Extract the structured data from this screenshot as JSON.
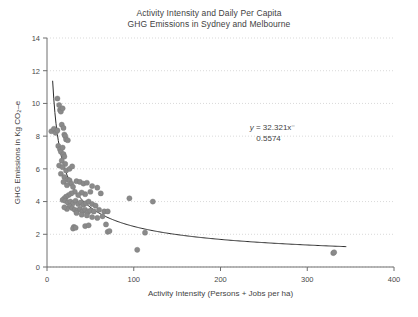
{
  "chart_data": {
    "type": "scatter",
    "title": "Activity Intensity and Daily Per Capita GHG Emissions in Sydney and Melbourne",
    "title_line1": "Activity Intensity and Daily Per Capita",
    "title_line2": "GHG Emissions in Sydney and Melbourne",
    "xlabel": "Activity Intensity (Persons + Jobs per ha)",
    "ylabel": "GHG Emissions in Kg CO₂–e",
    "xlim": [
      0,
      400
    ],
    "ylim": [
      0,
      14
    ],
    "xticks": [
      0,
      100,
      200,
      300,
      400
    ],
    "yticks": [
      0,
      2,
      4,
      6,
      8,
      10,
      12,
      14
    ],
    "xtick_labels": [
      "0",
      "100",
      "200",
      "300",
      "400"
    ],
    "ytick_labels": [
      "0",
      "2",
      "4",
      "6",
      "8",
      "10",
      "12",
      "14"
    ],
    "grid": "horizontal-dotted",
    "legend": "none",
    "marker_color": "#8a8a8a",
    "trendline_color": "#2b2b2b",
    "annotation": {
      "text": "y = 32.321x−0.5574",
      "line1_italic": "y",
      "line1_rest": " = 32.321x⁻",
      "line2": "0.5574",
      "equation_type": "power",
      "coefficient": 32.321,
      "exponent": -0.5574,
      "x": 260,
      "y": 8.35
    },
    "series": [
      {
        "name": "Sydney and Melbourne suburbs",
        "marker": "circle",
        "points": [
          [
            5,
            8.3
          ],
          [
            8,
            8.45
          ],
          [
            10,
            8.2
          ],
          [
            12,
            10.3
          ],
          [
            14,
            9.9
          ],
          [
            15,
            9.6
          ],
          [
            16,
            9.5
          ],
          [
            17,
            8.7
          ],
          [
            18,
            9.7
          ],
          [
            19,
            8.5
          ],
          [
            20,
            8.1
          ],
          [
            21,
            8.0
          ],
          [
            22,
            7.8
          ],
          [
            24,
            7.75
          ],
          [
            13,
            7.4
          ],
          [
            15,
            7.2
          ],
          [
            16,
            7.05
          ],
          [
            18,
            7.3
          ],
          [
            19,
            6.9
          ],
          [
            20,
            6.75
          ],
          [
            17,
            6.5
          ],
          [
            21,
            6.3
          ],
          [
            14,
            6.2
          ],
          [
            18,
            6.1
          ],
          [
            22,
            5.9
          ],
          [
            16,
            5.7
          ],
          [
            20,
            5.5
          ],
          [
            24,
            5.35
          ],
          [
            19,
            5.2
          ],
          [
            26,
            5.3
          ],
          [
            28,
            5.1
          ],
          [
            23,
            5.0
          ],
          [
            30,
            4.9
          ],
          [
            34,
            5.25
          ],
          [
            38,
            5.2
          ],
          [
            42,
            5.1
          ],
          [
            46,
            5.15
          ],
          [
            52,
            4.95
          ],
          [
            58,
            4.85
          ],
          [
            62,
            4.5
          ],
          [
            50,
            4.6
          ],
          [
            44,
            4.45
          ],
          [
            40,
            4.55
          ],
          [
            36,
            4.4
          ],
          [
            32,
            4.6
          ],
          [
            28,
            4.5
          ],
          [
            25,
            4.4
          ],
          [
            22,
            4.3
          ],
          [
            20,
            4.2
          ],
          [
            18,
            4.1
          ],
          [
            21,
            4.05
          ],
          [
            24,
            3.95
          ],
          [
            27,
            4.0
          ],
          [
            30,
            3.9
          ],
          [
            33,
            4.05
          ],
          [
            36,
            3.85
          ],
          [
            39,
            3.95
          ],
          [
            42,
            3.8
          ],
          [
            45,
            3.9
          ],
          [
            48,
            4.0
          ],
          [
            52,
            3.85
          ],
          [
            56,
            3.75
          ],
          [
            26,
            3.7
          ],
          [
            29,
            3.6
          ],
          [
            32,
            3.5
          ],
          [
            35,
            3.45
          ],
          [
            38,
            3.55
          ],
          [
            41,
            3.4
          ],
          [
            44,
            3.5
          ],
          [
            47,
            3.35
          ],
          [
            23,
            3.55
          ],
          [
            20,
            3.65
          ],
          [
            50,
            3.45
          ],
          [
            54,
            3.4
          ],
          [
            60,
            3.5
          ],
          [
            66,
            3.4
          ],
          [
            70,
            3.4
          ],
          [
            64,
            3.1
          ],
          [
            58,
            3.0
          ],
          [
            52,
            3.05
          ],
          [
            46,
            3.15
          ],
          [
            40,
            3.2
          ],
          [
            34,
            3.3
          ],
          [
            31,
            2.45
          ],
          [
            30,
            2.35
          ],
          [
            33,
            2.4
          ],
          [
            44,
            2.5
          ],
          [
            48,
            2.55
          ],
          [
            68,
            2.6
          ],
          [
            70,
            2.15
          ],
          [
            72,
            2.2
          ],
          [
            95,
            4.2
          ],
          [
            122,
            4.0
          ],
          [
            113,
            2.1
          ],
          [
            104,
            1.05
          ],
          [
            330,
            0.85
          ],
          [
            331,
            0.9
          ],
          [
            12,
            8.35
          ],
          [
            26,
            6.0
          ],
          [
            29,
            6.15
          ]
        ]
      }
    ],
    "trendline": {
      "name": "Power fit",
      "formula": "y = 32.321 * x^-0.5574",
      "x_start": 6.5,
      "x_end": 345
    }
  }
}
